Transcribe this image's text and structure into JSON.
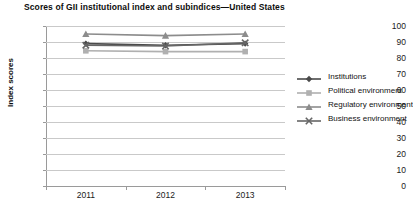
{
  "chart_data": {
    "type": "line",
    "title": "Scores of GII institutional index and subindices—United States",
    "subtitle": "",
    "xlabel": "",
    "ylabel": "Index scores",
    "categories": [
      "2011",
      "2012",
      "2013"
    ],
    "ylim": [
      0,
      100
    ],
    "yticks": [
      0,
      10,
      20,
      30,
      40,
      50,
      60,
      70,
      80,
      90,
      100
    ],
    "ytick_labels": [
      "0",
      "10",
      "20",
      "30",
      "40",
      "50",
      "60",
      "70",
      "80",
      "90",
      "100"
    ],
    "grid": true,
    "legend_position": "right",
    "series": [
      {
        "name": "Institutions",
        "marker": "diamond",
        "color": "#4a4a4a",
        "values": [
          89.0,
          88.0,
          89.0
        ]
      },
      {
        "name": "Political environment",
        "marker": "square",
        "color": "#b0b0b0",
        "values": [
          84.5,
          84.0,
          84.0
        ]
      },
      {
        "name": "Regulatory environment",
        "marker": "triangle",
        "color": "#8c8c8c",
        "values": [
          95.0,
          94.0,
          95.0
        ]
      },
      {
        "name": "Business environment",
        "marker": "cross",
        "color": "#666666",
        "values": [
          88.0,
          87.5,
          89.5
        ]
      }
    ]
  },
  "legend": {
    "items": [
      {
        "label": "Institutions"
      },
      {
        "label": "Political environment"
      },
      {
        "label": "Regulatory environment"
      },
      {
        "label": "Business environment"
      }
    ]
  }
}
